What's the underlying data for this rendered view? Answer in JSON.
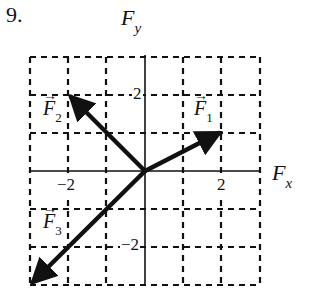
{
  "problem_number": "9.",
  "axes": {
    "x_label": "F",
    "x_sub": "x",
    "y_label": "F",
    "y_sub": "y",
    "x_range": [
      -3,
      3
    ],
    "y_range": [
      -3,
      3
    ],
    "grid": "dashed",
    "ticks": {
      "x_neg": "−2",
      "x_pos": "2",
      "y_pos": "2",
      "y_neg": "−2"
    }
  },
  "vectors": [
    {
      "name": "F",
      "sub": "1",
      "arrow": "→",
      "x": 2,
      "y": 1
    },
    {
      "name": "F",
      "sub": "2",
      "arrow": "→",
      "x": -2,
      "y": 2
    },
    {
      "name": "F",
      "sub": "3",
      "arrow": "→",
      "x": -3,
      "y": -3
    }
  ],
  "colors": {
    "ink": "#111111",
    "background": "#ffffff"
  }
}
